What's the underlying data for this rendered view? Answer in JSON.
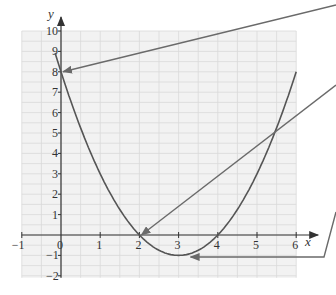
{
  "chart_data": {
    "type": "line",
    "title": "",
    "xlabel": "x",
    "ylabel": "y",
    "xlim": [
      -1,
      6
    ],
    "ylim": [
      -2,
      10
    ],
    "grid": true,
    "grid_minor_step": 0.5,
    "x_ticks": [
      "-1",
      "0",
      "1",
      "2",
      "3",
      "4",
      "5",
      "6"
    ],
    "y_ticks": [
      "-2",
      "-1",
      "1",
      "2",
      "3",
      "4",
      "5",
      "6",
      "7",
      "8",
      "9",
      "10"
    ],
    "series": [
      {
        "name": "y = x^2 - 6x + 8",
        "x": [
          0,
          0.5,
          1,
          1.5,
          2,
          2.5,
          3,
          3.5,
          4,
          4.5,
          5,
          5.5,
          6
        ],
        "values": [
          8,
          5.25,
          3,
          1.25,
          0,
          -0.75,
          -1,
          -0.75,
          0,
          1.25,
          3,
          5.25,
          8
        ]
      }
    ],
    "annotations": [
      {
        "name": "y-intercept",
        "point": [
          0,
          8
        ],
        "type": "arrow"
      },
      {
        "name": "root",
        "point": [
          2,
          0
        ],
        "type": "arrow"
      },
      {
        "name": "vertex",
        "point": [
          3,
          -1
        ],
        "type": "arrow"
      }
    ]
  },
  "colors": {
    "grid": "#d9d9d9",
    "grid_bg": "#f2f2f2",
    "curve": "#555555",
    "axis": "#333333",
    "arrow": "#6a6a6a"
  }
}
